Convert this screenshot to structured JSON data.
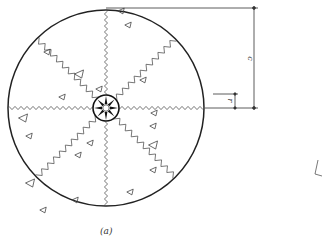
{
  "figure": {
    "caption": "(a)",
    "dimension_labels": {
      "outer": "c",
      "inner": "r"
    },
    "colors": {
      "stroke": "#222222",
      "zigzag": "#555555",
      "background": "#ffffff"
    },
    "circle": {
      "cx": 106,
      "cy": 108,
      "radius": 98
    },
    "hub": {
      "radius": 13,
      "spokes": 8
    },
    "zigzag_rays": {
      "count": 8,
      "angles_deg": [
        0,
        45,
        90,
        135,
        180,
        225,
        270,
        315
      ]
    },
    "triangles": [
      {
        "x": 128,
        "y": 25
      },
      {
        "x": 121,
        "y": 11
      },
      {
        "x": 47,
        "y": 52
      },
      {
        "x": 79,
        "y": 74
      },
      {
        "x": 62,
        "y": 97
      },
      {
        "x": 99,
        "y": 89
      },
      {
        "x": 143,
        "y": 80
      },
      {
        "x": 154,
        "y": 113
      },
      {
        "x": 23,
        "y": 118
      },
      {
        "x": 29,
        "y": 136
      },
      {
        "x": 90,
        "y": 143
      },
      {
        "x": 78,
        "y": 155
      },
      {
        "x": 153,
        "y": 126
      },
      {
        "x": 153,
        "y": 145
      },
      {
        "x": 130,
        "y": 192
      },
      {
        "x": 75,
        "y": 200
      },
      {
        "x": 153,
        "y": 170
      },
      {
        "x": 43,
        "y": 210
      },
      {
        "x": 30,
        "y": 183
      }
    ]
  }
}
